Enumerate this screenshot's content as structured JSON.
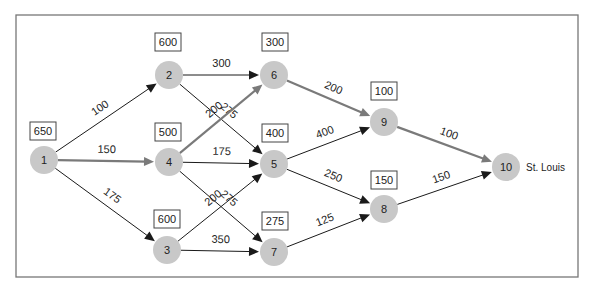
{
  "diagram": {
    "type": "network",
    "destination_label": "St. Louis",
    "colors": {
      "node_fill": "#c8c8c8",
      "critical_edge": "#7a7a7a",
      "normal_edge": "#1a1a1a",
      "frame": "#777777"
    },
    "nodes": [
      {
        "id": "1",
        "x": 44,
        "y": 160,
        "box": "650",
        "bx": 30,
        "by": 122
      },
      {
        "id": "2",
        "x": 169,
        "y": 75,
        "box": "600",
        "bx": 155,
        "by": 33
      },
      {
        "id": "3",
        "x": 167,
        "y": 250,
        "box": "600",
        "bx": 154,
        "by": 210
      },
      {
        "id": "4",
        "x": 169,
        "y": 162,
        "box": "500",
        "bx": 155,
        "by": 123
      },
      {
        "id": "5",
        "x": 274,
        "y": 164,
        "box": "400",
        "bx": 262,
        "by": 124
      },
      {
        "id": "6",
        "x": 274,
        "y": 75,
        "box": "300",
        "bx": 262,
        "by": 33
      },
      {
        "id": "7",
        "x": 274,
        "y": 252,
        "box": "275",
        "bx": 262,
        "by": 212
      },
      {
        "id": "8",
        "x": 384,
        "y": 209,
        "box": "150",
        "bx": 371,
        "by": 171
      },
      {
        "id": "9",
        "x": 384,
        "y": 122,
        "box": "100",
        "bx": 371,
        "by": 82
      },
      {
        "id": "10",
        "x": 506,
        "y": 167,
        "box": "",
        "bx": 0,
        "by": 0
      }
    ],
    "edges": [
      {
        "from": "1",
        "to": "2",
        "label": "100",
        "critical": false
      },
      {
        "from": "1",
        "to": "4",
        "label": "150",
        "critical": true
      },
      {
        "from": "1",
        "to": "3",
        "label": "175",
        "critical": false
      },
      {
        "from": "2",
        "to": "6",
        "label": "300",
        "critical": false
      },
      {
        "from": "2",
        "to": "5",
        "label": "275",
        "critical": false
      },
      {
        "from": "4",
        "to": "6",
        "label": "200",
        "critical": true
      },
      {
        "from": "4",
        "to": "5",
        "label": "175",
        "critical": false
      },
      {
        "from": "4",
        "to": "7",
        "label": "275",
        "critical": false
      },
      {
        "from": "3",
        "to": "5",
        "label": "200",
        "critical": false
      },
      {
        "from": "3",
        "to": "7",
        "label": "350",
        "critical": false
      },
      {
        "from": "6",
        "to": "9",
        "label": "200",
        "critical": true
      },
      {
        "from": "5",
        "to": "9",
        "label": "400",
        "critical": false
      },
      {
        "from": "5",
        "to": "8",
        "label": "250",
        "critical": false
      },
      {
        "from": "7",
        "to": "8",
        "label": "125",
        "critical": false
      },
      {
        "from": "9",
        "to": "10",
        "label": "100",
        "critical": true
      },
      {
        "from": "8",
        "to": "10",
        "label": "150",
        "critical": false
      }
    ]
  }
}
